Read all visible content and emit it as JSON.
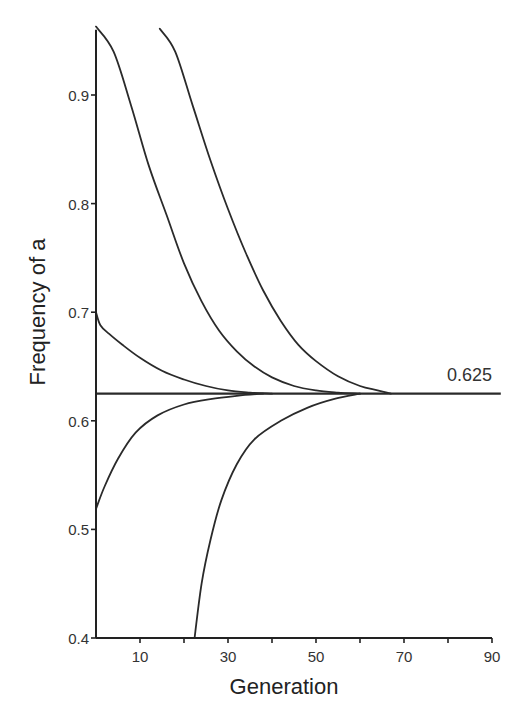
{
  "chart_data": {
    "type": "line",
    "title": "",
    "xlabel": "Generation",
    "ylabel": "Frequency of a",
    "xlim": [
      0,
      90
    ],
    "ylim": [
      0.4,
      0.96
    ],
    "grid": false,
    "legend": null,
    "x_ticks": [
      {
        "value": 10,
        "label": "10"
      },
      {
        "value": 20,
        "label": ""
      },
      {
        "value": 30,
        "label": "30"
      },
      {
        "value": 40,
        "label": ""
      },
      {
        "value": 50,
        "label": "50"
      },
      {
        "value": 60,
        "label": ""
      },
      {
        "value": 70,
        "label": "70"
      },
      {
        "value": 80,
        "label": ""
      },
      {
        "value": 90,
        "label": "90"
      }
    ],
    "y_ticks": [
      {
        "value": 0.4,
        "label": "0.4"
      },
      {
        "value": 0.5,
        "label": "0.5"
      },
      {
        "value": 0.6,
        "label": "0.6"
      },
      {
        "value": 0.7,
        "label": "0.7"
      },
      {
        "value": 0.8,
        "label": "0.8"
      },
      {
        "value": 0.9,
        "label": "0.9"
      }
    ],
    "annotations": [
      {
        "text": "0.625",
        "x": 80,
        "y": 0.625,
        "description": "equilibrium frequency"
      }
    ],
    "series": [
      {
        "name": "start 0.963 at gen 0",
        "x": [
          0,
          4,
          8,
          12,
          16,
          20,
          24,
          28,
          32,
          36,
          40,
          45,
          50,
          55,
          60
        ],
        "y": [
          0.963,
          0.94,
          0.89,
          0.835,
          0.79,
          0.745,
          0.71,
          0.683,
          0.664,
          0.65,
          0.64,
          0.632,
          0.628,
          0.626,
          0.625
        ]
      },
      {
        "name": "start 0.961 at gen 14.5",
        "x": [
          14.5,
          18,
          22,
          26,
          30,
          34,
          38,
          42,
          46,
          50,
          55,
          60,
          64,
          67
        ],
        "y": [
          0.961,
          0.94,
          0.89,
          0.84,
          0.795,
          0.755,
          0.72,
          0.692,
          0.67,
          0.655,
          0.641,
          0.632,
          0.628,
          0.625
        ]
      },
      {
        "name": "start 0.70 at gen 0",
        "x": [
          0,
          1,
          3,
          6,
          10,
          15,
          20,
          25,
          30,
          35,
          40
        ],
        "y": [
          0.7,
          0.688,
          0.68,
          0.67,
          0.658,
          0.646,
          0.638,
          0.632,
          0.628,
          0.626,
          0.625
        ]
      },
      {
        "name": "start 0.519 at gen 0",
        "x": [
          0,
          2,
          5,
          9,
          14,
          20,
          26,
          32,
          38
        ],
        "y": [
          0.519,
          0.54,
          0.565,
          0.589,
          0.605,
          0.615,
          0.62,
          0.623,
          0.625
        ]
      },
      {
        "name": "start 0.40 at gen 22.4",
        "x": [
          22.4,
          24,
          26,
          28.5,
          32,
          36,
          42,
          48,
          54,
          60
        ],
        "y": [
          0.4,
          0.45,
          0.49,
          0.527,
          0.56,
          0.583,
          0.6,
          0.612,
          0.62,
          0.625
        ]
      },
      {
        "name": "equilibrium 0.625",
        "x": [
          0,
          92
        ],
        "y": [
          0.625,
          0.625
        ]
      }
    ]
  },
  "layout": {
    "plot": {
      "x0_px": 96,
      "px_per_gen": 4.4,
      "y_base_px": 638,
      "y_base_val": 0.4,
      "px_per_unit": 1086
    },
    "colors": {
      "line": "#2a2a2a",
      "axis": "#222222",
      "text": "#333333",
      "background": "#ffffff"
    }
  }
}
